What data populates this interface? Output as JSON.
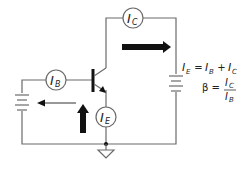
{
  "diagram": {
    "meters": [
      {
        "id": "ic",
        "main": "I",
        "sub": "C"
      },
      {
        "id": "ib",
        "main": "I",
        "sub": "B"
      },
      {
        "id": "ie",
        "main": "I",
        "sub": "E"
      }
    ],
    "equations": {
      "eq1": {
        "lhs_main": "I",
        "lhs_sub": "E",
        "eq": " = ",
        "t1_main": "I",
        "t1_sub": "B",
        "plus": " + ",
        "t2_main": "I",
        "t2_sub": "C"
      },
      "eq2": {
        "beta": "β = ",
        "num_main": "I",
        "num_sub": "C",
        "den_main": "I",
        "den_sub": "B"
      }
    },
    "components": [
      "NPN transistor",
      "base battery",
      "collector battery",
      "ground"
    ],
    "arrows": [
      {
        "name": "collector-current-arrow",
        "direction": "right",
        "style": "thick"
      },
      {
        "name": "emitter-current-arrow",
        "direction": "up",
        "style": "thick"
      },
      {
        "name": "base-current-arrow",
        "direction": "left",
        "style": "thin"
      }
    ],
    "colors": {
      "wire": "#6a6a6a",
      "arrow": "#111111",
      "text": "#222222"
    }
  }
}
